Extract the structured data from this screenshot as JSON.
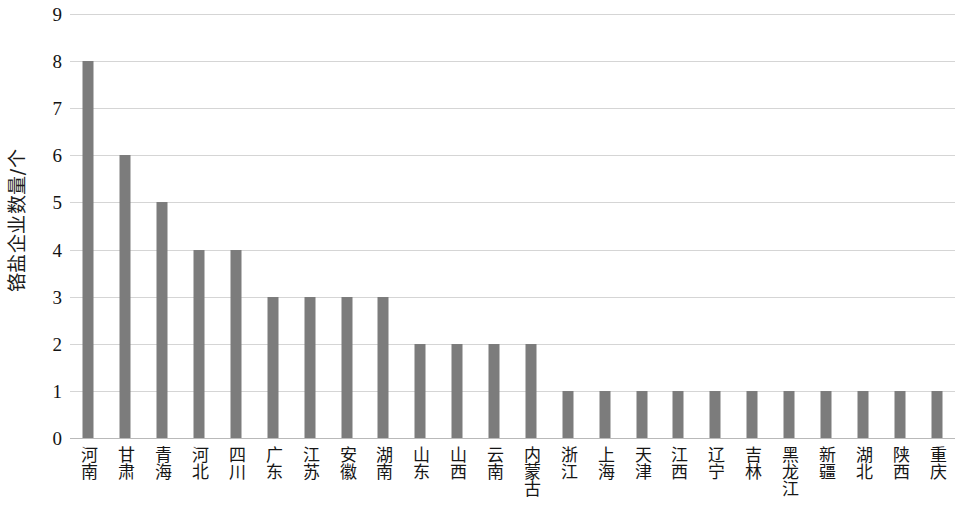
{
  "chart_data": {
    "type": "bar",
    "title": "",
    "subtitle": "",
    "xlabel": "",
    "ylabel": "铬盐企业数量/个",
    "ylim": [
      0,
      9
    ],
    "ytick_values": [
      0,
      1,
      2,
      3,
      4,
      5,
      6,
      7,
      8,
      9
    ],
    "ytick_labels": [
      "0",
      "1",
      "2",
      "3",
      "4",
      "5",
      "6",
      "7",
      "8",
      "9"
    ],
    "grid": true,
    "legend": null,
    "legend_position": "none",
    "bar_color": "#7c7c7c",
    "gridline_color": "#d5d5d5",
    "axis_color": "#b9b9b9",
    "categories": [
      "河南",
      "甘肃",
      "青海",
      "河北",
      "四川",
      "广东",
      "江苏",
      "安徽",
      "湖南",
      "山东",
      "山西",
      "云南",
      "内蒙古",
      "浙江",
      "上海",
      "天津",
      "江西",
      "辽宁",
      "吉林",
      "黑龙江",
      "新疆",
      "湖北",
      "陕西",
      "重庆"
    ],
    "values": [
      8,
      6,
      5,
      4,
      4,
      3,
      3,
      3,
      3,
      2,
      2,
      2,
      2,
      1,
      1,
      1,
      1,
      1,
      1,
      1,
      1,
      1,
      1,
      1
    ]
  }
}
